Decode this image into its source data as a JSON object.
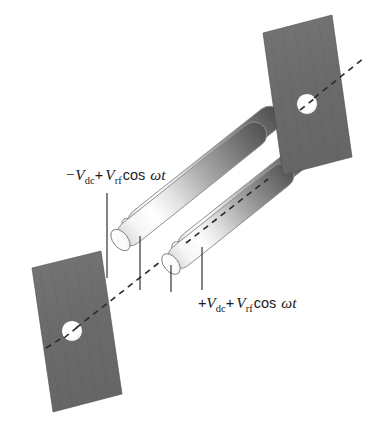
{
  "figure": {
    "background_color": "#ffffff"
  },
  "labels": {
    "negative_rod_label": {
      "name": "negative-dc-label",
      "full_text": "−Vdc + Vrf cos ωt",
      "sign": "−",
      "v_symbol": "V",
      "dc_subscript": "dc",
      "plus": "+",
      "v_symbol2": "V",
      "rf_subscript": "rf",
      "cos_text": "cos",
      "omega": "ω",
      "t_symbol": "t"
    },
    "positive_rod_label": {
      "name": "positive-dc-label",
      "full_text": "+Vdc + Vrf cos ωt",
      "sign": "+",
      "v_symbol": "V",
      "dc_subscript": "dc",
      "plus": "+",
      "v_symbol2": "V",
      "rf_subscript": "rf",
      "cos_text": "cos",
      "omega": "ω",
      "t_symbol": "t"
    }
  },
  "elements": {
    "plate_top_right": {
      "name": "aperture-plate-top-right",
      "fill": "#6e6e6e",
      "aperture_fill": "#fbfbfb"
    },
    "plate_bottom_left": {
      "name": "aperture-plate-bottom-left",
      "fill": "#6e6e6e",
      "aperture_fill": "#fbfbfb"
    },
    "axis": {
      "name": "ion-beam-axis",
      "style": "dashed",
      "color": "#2a2a2a"
    },
    "rods": {
      "name": "quadrupole-rods",
      "count": 4,
      "highlight_color": "#ffffff",
      "shadow_color": "#4a4a4a",
      "cap_color": "#ffffff"
    }
  },
  "colors": {
    "plate_gray": "#6e6e6e",
    "rod_dark": "#4a4a4a",
    "rod_light": "#ffffff",
    "line_black": "#1f1f1f",
    "background": "#ffffff"
  }
}
